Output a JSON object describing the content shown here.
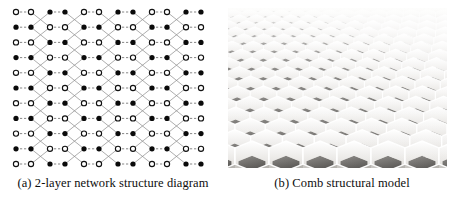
{
  "figure": {
    "width": 458,
    "height": 204,
    "background": "#ffffff",
    "panels": [
      {
        "id": "a",
        "caption": "(a) 2-layer network structure diagram",
        "kind": "network-structure-diagram"
      },
      {
        "id": "b",
        "caption": "(b) Comb structural model",
        "kind": "honeycomb-photograph"
      }
    ]
  },
  "panel_a": {
    "caption": "(a) 2-layer network structure diagram",
    "diagram": {
      "rows": 11,
      "columns": 12,
      "column_pairs": 6,
      "node_types": [
        "filled",
        "hollow"
      ],
      "filled_color": "#0a0a0a",
      "hollow_fill": "#ffffff",
      "hollow_stroke": "#111111",
      "node_radius": 2.6,
      "pair_link_style": "dashed-horizontal",
      "pair_link_color": "#6f6f6f",
      "zigzag_link_color": "#8a8a8a",
      "origin_x": 10,
      "origin_y": 8,
      "pair_gap": 15,
      "pair_pitch": 34,
      "row_pitch": 15.2,
      "legend": {
        "filled_meaning": "layer-1 node",
        "hollow_meaning": "layer-2 node"
      }
    }
  },
  "panel_b": {
    "caption": "(b) Comb structural model",
    "photo": {
      "subject": "aluminium honeycomb core, perspective view",
      "cell_shape": "hexagon",
      "wall_color_light": "#f2f1ef",
      "wall_color_mid": "#cfcdc9",
      "cavity_dark": "#6e6c69",
      "cavity_darkest": "#4a4845",
      "background": "#fbfbfa",
      "rows": 12,
      "perspective": "receding to upper-right"
    }
  }
}
